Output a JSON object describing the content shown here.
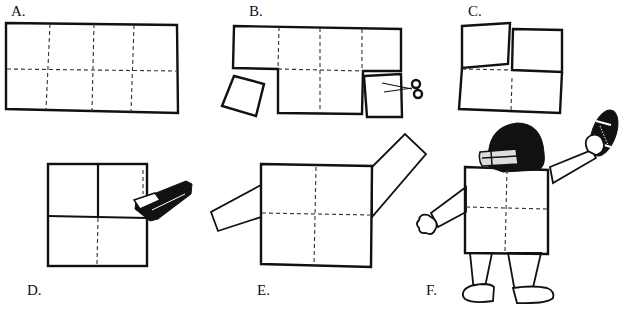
{
  "diagram": {
    "type": "instructional-craft-steps",
    "steps": [
      {
        "id": "A",
        "label": "A.",
        "description": "Rectangle of paper divided into 8 squares by dashed fold lines (4 columns x 2 rows)"
      },
      {
        "id": "B",
        "label": "B.",
        "description": "Two bottom corner squares cut away with scissors"
      },
      {
        "id": "C",
        "label": "C.",
        "description": "Top squares folded over to form a square"
      },
      {
        "id": "D",
        "label": "D.",
        "description": "Folded layers stapled together"
      },
      {
        "id": "E",
        "label": "E.",
        "description": "Paper strips attached as arms"
      },
      {
        "id": "F",
        "label": "F.",
        "description": "Finished football player figure with helmet, arms, legs and football"
      }
    ],
    "icons": [
      "scissors-icon",
      "stapler-icon",
      "football-icon",
      "helmet-icon"
    ],
    "colors": {
      "ink": "#111111",
      "paper": "#ffffff"
    }
  }
}
